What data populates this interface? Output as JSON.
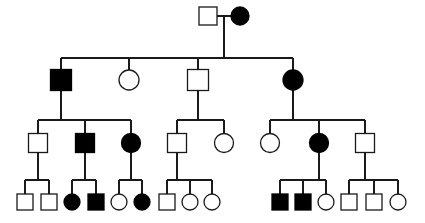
{
  "figure": {
    "kind": "pedigree-chart",
    "title": "",
    "caption": "",
    "background_color": "#ffffff",
    "line_color": "#1a1a1a",
    "affected_fill": "#000000",
    "unaffected_fill": "#ffffff",
    "width": 425,
    "height": 223
  },
  "legend": {
    "male_symbol": "square",
    "female_symbol": "circle",
    "affected_meaning": "filled",
    "unaffected_meaning": "open"
  },
  "chart_data": {
    "type": "diagram",
    "title": "",
    "generations": 4,
    "counts": {
      "total_individuals": 33,
      "affected": 12,
      "unaffected": 21,
      "males": 17,
      "females": 16
    },
    "individuals": [
      {
        "id": "I-1",
        "generation": 1,
        "sex": "male",
        "affected": false,
        "shape": "square",
        "x": 208,
        "y": 16,
        "size": 18
      },
      {
        "id": "I-2",
        "generation": 1,
        "sex": "female",
        "affected": true,
        "shape": "circle",
        "x": 240,
        "y": 16,
        "size": 18
      },
      {
        "id": "II-1",
        "generation": 2,
        "sex": "male",
        "affected": true,
        "shape": "square",
        "x": 61,
        "y": 80,
        "size": 21
      },
      {
        "id": "II-2",
        "generation": 2,
        "sex": "female",
        "affected": false,
        "shape": "circle",
        "x": 129,
        "y": 80,
        "size": 20
      },
      {
        "id": "II-3",
        "generation": 2,
        "sex": "male",
        "affected": false,
        "shape": "square",
        "x": 198,
        "y": 80,
        "size": 21
      },
      {
        "id": "II-4",
        "generation": 2,
        "sex": "female",
        "affected": true,
        "shape": "circle",
        "x": 293,
        "y": 80,
        "size": 20
      },
      {
        "id": "III-1",
        "generation": 3,
        "sex": "male",
        "affected": false,
        "shape": "square",
        "x": 38,
        "y": 143,
        "size": 19
      },
      {
        "id": "III-2",
        "generation": 3,
        "sex": "male",
        "affected": true,
        "shape": "square",
        "x": 85,
        "y": 143,
        "size": 19
      },
      {
        "id": "III-3",
        "generation": 3,
        "sex": "female",
        "affected": true,
        "shape": "circle",
        "x": 131,
        "y": 143,
        "size": 19
      },
      {
        "id": "III-4",
        "generation": 3,
        "sex": "male",
        "affected": false,
        "shape": "square",
        "x": 177,
        "y": 143,
        "size": 19
      },
      {
        "id": "III-5",
        "generation": 3,
        "sex": "female",
        "affected": false,
        "shape": "circle",
        "x": 224,
        "y": 143,
        "size": 19
      },
      {
        "id": "III-6",
        "generation": 3,
        "sex": "female",
        "affected": false,
        "shape": "circle",
        "x": 270,
        "y": 143,
        "size": 19
      },
      {
        "id": "III-7",
        "generation": 3,
        "sex": "female",
        "affected": true,
        "shape": "circle",
        "x": 319,
        "y": 143,
        "size": 19
      },
      {
        "id": "III-8",
        "generation": 3,
        "sex": "male",
        "affected": false,
        "shape": "square",
        "x": 365,
        "y": 143,
        "size": 19
      },
      {
        "id": "IV-1",
        "generation": 4,
        "sex": "male",
        "affected": false,
        "shape": "square",
        "x": 25,
        "y": 202,
        "size": 16
      },
      {
        "id": "IV-2",
        "generation": 4,
        "sex": "male",
        "affected": false,
        "shape": "square",
        "x": 49,
        "y": 202,
        "size": 16
      },
      {
        "id": "IV-3",
        "generation": 4,
        "sex": "female",
        "affected": true,
        "shape": "circle",
        "x": 72,
        "y": 202,
        "size": 16
      },
      {
        "id": "IV-4",
        "generation": 4,
        "sex": "male",
        "affected": true,
        "shape": "square",
        "x": 96,
        "y": 202,
        "size": 16
      },
      {
        "id": "IV-5",
        "generation": 4,
        "sex": "female",
        "affected": false,
        "shape": "circle",
        "x": 119,
        "y": 202,
        "size": 16
      },
      {
        "id": "IV-6",
        "generation": 4,
        "sex": "female",
        "affected": true,
        "shape": "circle",
        "x": 142,
        "y": 202,
        "size": 16
      },
      {
        "id": "IV-7",
        "generation": 4,
        "sex": "male",
        "affected": false,
        "shape": "square",
        "x": 167,
        "y": 202,
        "size": 16
      },
      {
        "id": "IV-8",
        "generation": 4,
        "sex": "female",
        "affected": false,
        "shape": "circle",
        "x": 190,
        "y": 202,
        "size": 16
      },
      {
        "id": "IV-9",
        "generation": 4,
        "sex": "female",
        "affected": false,
        "shape": "circle",
        "x": 212,
        "y": 202,
        "size": 16
      },
      {
        "id": "IV-10",
        "generation": 4,
        "sex": "male",
        "affected": true,
        "shape": "square",
        "x": 280,
        "y": 202,
        "size": 16
      },
      {
        "id": "IV-11",
        "generation": 4,
        "sex": "male",
        "affected": true,
        "shape": "square",
        "x": 303,
        "y": 202,
        "size": 16
      },
      {
        "id": "IV-12",
        "generation": 4,
        "sex": "female",
        "affected": false,
        "shape": "circle",
        "x": 326,
        "y": 202,
        "size": 16
      },
      {
        "id": "IV-13",
        "generation": 4,
        "sex": "male",
        "affected": false,
        "shape": "square",
        "x": 349,
        "y": 202,
        "size": 16
      },
      {
        "id": "IV-14",
        "generation": 4,
        "sex": "male",
        "affected": false,
        "shape": "square",
        "x": 374,
        "y": 202,
        "size": 16
      },
      {
        "id": "IV-15",
        "generation": 4,
        "sex": "female",
        "affected": false,
        "shape": "circle",
        "x": 398,
        "y": 202,
        "size": 16
      }
    ],
    "mating_lines": [
      {
        "id": "mate-I",
        "x1": 217,
        "x2": 231,
        "y": 16
      }
    ],
    "descent_lines": [
      {
        "id": "descent-I-to-II",
        "x": 224,
        "y1": 16,
        "y2": 58
      },
      {
        "id": "descent-II-1",
        "x": 61,
        "y1": 90,
        "y2": 120
      },
      {
        "id": "descent-II-3",
        "x": 198,
        "y1": 90,
        "y2": 120
      },
      {
        "id": "descent-II-4",
        "x": 293,
        "y1": 90,
        "y2": 120
      },
      {
        "id": "descent-III-1",
        "x": 38,
        "y1": 152,
        "y2": 180
      },
      {
        "id": "descent-III-2",
        "x": 85,
        "y1": 152,
        "y2": 180
      },
      {
        "id": "descent-III-3",
        "x": 131,
        "y1": 152,
        "y2": 180
      },
      {
        "id": "descent-III-4",
        "x": 177,
        "y1": 152,
        "y2": 180
      },
      {
        "id": "descent-III-7",
        "x": 319,
        "y1": 152,
        "y2": 180
      },
      {
        "id": "descent-III-8",
        "x": 365,
        "y1": 152,
        "y2": 180
      }
    ],
    "sibship_lines": [
      {
        "id": "sibship-II",
        "x1": 61,
        "x2": 293,
        "y": 58
      },
      {
        "id": "sibship-III-left",
        "x1": 38,
        "x2": 131,
        "y": 120
      },
      {
        "id": "sibship-III-mid",
        "x1": 177,
        "x2": 224,
        "y": 120
      },
      {
        "id": "sibship-III-right",
        "x1": 270,
        "x2": 365,
        "y": 120
      },
      {
        "id": "sibship-IV-a",
        "x1": 25,
        "x2": 49,
        "y": 180
      },
      {
        "id": "sibship-IV-b",
        "x1": 72,
        "x2": 96,
        "y": 180
      },
      {
        "id": "sibship-IV-c",
        "x1": 119,
        "x2": 142,
        "y": 180
      },
      {
        "id": "sibship-IV-d",
        "x1": 167,
        "x2": 212,
        "y": 180
      },
      {
        "id": "sibship-IV-e",
        "x1": 280,
        "x2": 326,
        "y": 180
      },
      {
        "id": "sibship-IV-f",
        "x1": 349,
        "x2": 398,
        "y": 180
      }
    ],
    "child_stubs": [
      {
        "id": "stub-II-1",
        "x": 61,
        "y1": 58,
        "y2": 70
      },
      {
        "id": "stub-II-2",
        "x": 129,
        "y1": 58,
        "y2": 70
      },
      {
        "id": "stub-II-3",
        "x": 198,
        "y1": 58,
        "y2": 70
      },
      {
        "id": "stub-II-4",
        "x": 293,
        "y1": 58,
        "y2": 70
      },
      {
        "id": "stub-III-1",
        "x": 38,
        "y1": 120,
        "y2": 134
      },
      {
        "id": "stub-III-2",
        "x": 85,
        "y1": 120,
        "y2": 134
      },
      {
        "id": "stub-III-3",
        "x": 131,
        "y1": 120,
        "y2": 134
      },
      {
        "id": "stub-III-4",
        "x": 177,
        "y1": 120,
        "y2": 134
      },
      {
        "id": "stub-III-5",
        "x": 224,
        "y1": 120,
        "y2": 134
      },
      {
        "id": "stub-III-6",
        "x": 270,
        "y1": 120,
        "y2": 134
      },
      {
        "id": "stub-III-7",
        "x": 319,
        "y1": 120,
        "y2": 134
      },
      {
        "id": "stub-III-8",
        "x": 365,
        "y1": 120,
        "y2": 134
      },
      {
        "id": "stub-IV-1",
        "x": 25,
        "y1": 180,
        "y2": 194
      },
      {
        "id": "stub-IV-2",
        "x": 49,
        "y1": 180,
        "y2": 194
      },
      {
        "id": "stub-IV-3",
        "x": 72,
        "y1": 180,
        "y2": 194
      },
      {
        "id": "stub-IV-4",
        "x": 96,
        "y1": 180,
        "y2": 194
      },
      {
        "id": "stub-IV-5",
        "x": 119,
        "y1": 180,
        "y2": 194
      },
      {
        "id": "stub-IV-6",
        "x": 142,
        "y1": 180,
        "y2": 194
      },
      {
        "id": "stub-IV-7",
        "x": 167,
        "y1": 180,
        "y2": 194
      },
      {
        "id": "stub-IV-8",
        "x": 190,
        "y1": 180,
        "y2": 194
      },
      {
        "id": "stub-IV-9",
        "x": 212,
        "y1": 180,
        "y2": 194
      },
      {
        "id": "stub-IV-10",
        "x": 280,
        "y1": 180,
        "y2": 194
      },
      {
        "id": "stub-IV-11",
        "x": 303,
        "y1": 180,
        "y2": 194
      },
      {
        "id": "stub-IV-12",
        "x": 326,
        "y1": 180,
        "y2": 194
      },
      {
        "id": "stub-IV-13",
        "x": 349,
        "y1": 180,
        "y2": 194
      },
      {
        "id": "stub-IV-14",
        "x": 374,
        "y1": 180,
        "y2": 194
      },
      {
        "id": "stub-IV-15",
        "x": 398,
        "y1": 180,
        "y2": 194
      }
    ]
  }
}
